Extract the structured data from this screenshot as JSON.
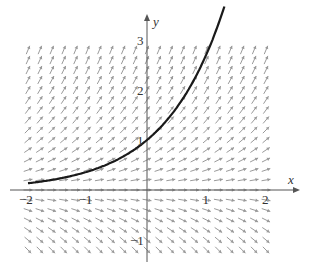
{
  "chart_data": {
    "type": "slope_field",
    "title": "",
    "equation": "dy/dx = y",
    "xlabel": "x",
    "ylabel": "y",
    "xlim": [
      -2,
      2
    ],
    "ylim": [
      -1,
      3
    ],
    "x_ticks": [
      -2,
      -1,
      1,
      2
    ],
    "x_tick_labels": [
      "−2",
      "−1",
      "1",
      "2"
    ],
    "y_ticks": [
      -1,
      1,
      2,
      3
    ],
    "y_tick_labels": [
      "−1",
      "1",
      "2",
      "3"
    ],
    "grid_step": 0.2,
    "solution_curve": {
      "label": "y = e^x",
      "through": [
        0,
        1
      ],
      "x_range": [
        -2,
        1.3
      ]
    },
    "colors": {
      "field": "#9a9a9a",
      "curve": "#1a1a1a",
      "axes": "#555555"
    },
    "grid": false,
    "legend": null
  }
}
